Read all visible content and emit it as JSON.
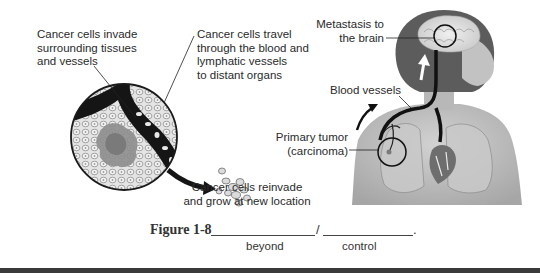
{
  "labels": {
    "invade": [
      "Cancer cells invade",
      "surrounding tissues",
      "and vessels"
    ],
    "travel": [
      "Cancer cells travel",
      "through the blood and",
      "lymphatic vessels",
      "to distant organs"
    ],
    "reinvade": [
      "Cancer cells reinvade",
      "and grow at new location"
    ],
    "metastasis": [
      "Metastasis to",
      "the brain"
    ],
    "blood_vessels": "Blood vessels",
    "primary_tumor": [
      "Primary tumor",
      "(carcinoma)"
    ]
  },
  "caption": {
    "figure_label": "Figure 1-8",
    "separator": "/",
    "end_punctuation": ".",
    "hints": [
      "beyond",
      "control"
    ]
  },
  "colors": {
    "ink": "#1a1a1a",
    "tissue": "#d9d9d9",
    "tumor": "#8a8a8a",
    "skin": "#b9b9b9",
    "hair": "#5a5a5a",
    "rule": "#3a3a3a"
  }
}
